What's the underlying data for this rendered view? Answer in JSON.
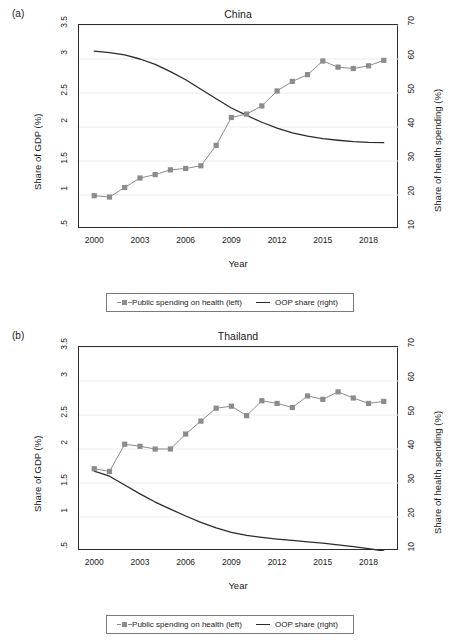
{
  "figure": {
    "panels": [
      {
        "label": "(a)",
        "title": "China",
        "xlabel": "Year",
        "ylabel_left": "Share of GDP (%)",
        "ylabel_right": "Share of health spending (%)"
      },
      {
        "label": "(b)",
        "title": "Thailand",
        "xlabel": "Year",
        "ylabel_left": "Share of GDP (%)",
        "ylabel_right": "Share of health spending (%)"
      }
    ],
    "legend": {
      "series1": "Public spending on health (left)",
      "series2": "OOP share (right)"
    },
    "colors": {
      "marker": "#8c8c8c",
      "line": "#2b2b2b",
      "grid": "#ececec",
      "frame": "#2b2b2b"
    }
  },
  "chart_data": [
    {
      "type": "line",
      "title": "China",
      "panel": "(a)",
      "xlabel": "Year",
      "ylabel": "Share of GDP (%)",
      "ylabel_right": "Share of health spending (%)",
      "xlim": [
        1999,
        2020
      ],
      "ylim": [
        0.5,
        3.5
      ],
      "ylim_right": [
        10,
        70
      ],
      "xticks": [
        2000,
        2003,
        2006,
        2009,
        2012,
        2015,
        2018
      ],
      "yticks": [
        ".5",
        "1",
        "1.5",
        "2",
        "2.5",
        "3",
        "3.5"
      ],
      "yticks_right": [
        10,
        20,
        30,
        40,
        50,
        60,
        70
      ],
      "grid": true,
      "legend_position": "below",
      "x": [
        2000,
        2001,
        2002,
        2003,
        2004,
        2005,
        2006,
        2007,
        2008,
        2009,
        2010,
        2011,
        2012,
        2013,
        2014,
        2015,
        2016,
        2017,
        2018,
        2019
      ],
      "series": [
        {
          "name": "Public spending on health (left)",
          "axis": "left",
          "marker": "square",
          "values": [
            0.99,
            0.97,
            1.11,
            1.25,
            1.3,
            1.37,
            1.39,
            1.43,
            1.73,
            2.14,
            2.19,
            2.31,
            2.53,
            2.67,
            2.77,
            2.97,
            2.88,
            2.86,
            2.9,
            2.98
          ]
        },
        {
          "name": "OOP share (right)",
          "axis": "right",
          "marker": "none",
          "values": [
            62.3,
            61.9,
            61.2,
            60.0,
            58.4,
            56.3,
            53.9,
            51.1,
            48.3,
            45.6,
            43.4,
            41.4,
            39.7,
            38.3,
            37.3,
            36.6,
            36.1,
            35.7,
            35.5,
            35.4
          ]
        }
      ]
    },
    {
      "type": "line",
      "title": "Thailand",
      "panel": "(b)",
      "xlabel": "Year",
      "ylabel": "Share of GDP (%)",
      "ylabel_right": "Share of health spending (%)",
      "xlim": [
        1999,
        2020
      ],
      "ylim": [
        0.5,
        3.5
      ],
      "ylim_right": [
        10,
        70
      ],
      "xticks": [
        2000,
        2003,
        2006,
        2009,
        2012,
        2015,
        2018
      ],
      "yticks": [
        ".5",
        "1",
        "1.5",
        "2",
        "2.5",
        "3",
        "3.5"
      ],
      "yticks_right": [
        10,
        20,
        30,
        40,
        50,
        60,
        70
      ],
      "grid": true,
      "legend_position": "below",
      "x": [
        2000,
        2001,
        2002,
        2003,
        2004,
        2005,
        2006,
        2007,
        2008,
        2009,
        2010,
        2011,
        2012,
        2013,
        2014,
        2015,
        2016,
        2017,
        2018,
        2019
      ],
      "series": [
        {
          "name": "Public spending on health (left)",
          "axis": "left",
          "marker": "square",
          "values": [
            1.71,
            1.67,
            2.07,
            2.04,
            2.0,
            2.0,
            2.22,
            2.41,
            2.6,
            2.63,
            2.49,
            2.71,
            2.67,
            2.61,
            2.78,
            2.73,
            2.84,
            2.75,
            2.67,
            2.7
          ]
        },
        {
          "name": "OOP share (right)",
          "axis": "right",
          "marker": "none",
          "values": [
            33.5,
            32.0,
            29.4,
            26.8,
            24.4,
            22.3,
            20.3,
            18.4,
            16.8,
            15.5,
            14.6,
            14.0,
            13.5,
            13.1,
            12.7,
            12.3,
            11.8,
            11.3,
            10.7,
            10.0
          ]
        }
      ]
    }
  ]
}
